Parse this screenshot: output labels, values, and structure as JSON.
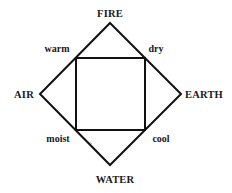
{
  "diagram": {
    "elements": {
      "top": "FIRE",
      "left": "AIR",
      "right": "EARTH",
      "bottom": "WATER"
    },
    "qualities": {
      "top_left": "warm",
      "top_right": "dry",
      "bottom_left": "moist",
      "bottom_right": "cool"
    },
    "colors": {
      "line": "#111111",
      "text": "#1a1a1a",
      "background": "#ffffff"
    }
  }
}
